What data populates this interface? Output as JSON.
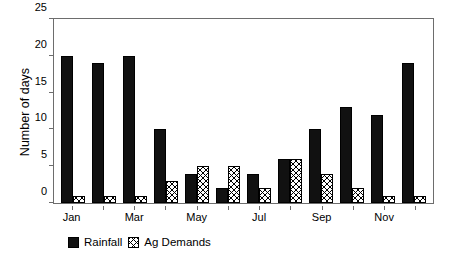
{
  "chart_data": {
    "type": "bar",
    "title": "",
    "xlabel": "",
    "ylabel": "Number of days",
    "ylim": [
      0,
      25
    ],
    "yticks": [
      0,
      5,
      10,
      15,
      20,
      25
    ],
    "grid": false,
    "legend_position": "bottom-left",
    "categories": [
      "Jan",
      "Feb",
      "Mar",
      "Apr",
      "May",
      "Jun",
      "Jul",
      "Aug",
      "Sep",
      "Oct",
      "Nov",
      "Dec"
    ],
    "visible_tick_labels": [
      "Jan",
      "",
      "Mar",
      "",
      "May",
      "",
      "Jul",
      "",
      "Sep",
      "",
      "Nov",
      ""
    ],
    "series": [
      {
        "name": "Rainfall",
        "color": "#111111",
        "pattern": "solid",
        "values": [
          20,
          19,
          20,
          10,
          4,
          2,
          4,
          6,
          10,
          13,
          12,
          19
        ]
      },
      {
        "name": "Ag Demands",
        "color": "#ffffff",
        "pattern": "cross-hatch",
        "values": [
          1,
          1,
          1,
          3,
          5,
          5,
          2,
          6,
          4,
          2,
          1,
          1
        ]
      }
    ]
  },
  "axes": {
    "frame_color": "#6d6d6d"
  }
}
